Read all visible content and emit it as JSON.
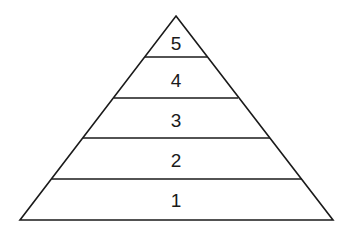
{
  "diagram": {
    "type": "pyramid",
    "levels": [
      {
        "label": "5",
        "position": "top"
      },
      {
        "label": "4"
      },
      {
        "label": "3"
      },
      {
        "label": "2"
      },
      {
        "label": "1",
        "position": "bottom"
      }
    ],
    "stroke_color": "#1a1a1a",
    "fill_color": "#ffffff"
  }
}
